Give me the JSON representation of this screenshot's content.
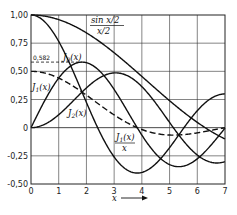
{
  "chart_data": {
    "type": "line",
    "title": "",
    "xlabel": "x",
    "ylabel": "",
    "xlim": [
      0,
      7
    ],
    "ylim": [
      -0.5,
      1.0
    ],
    "grid": true,
    "legend_position": "inline labels",
    "x_ticks": [
      "0",
      "1",
      "2",
      "3",
      "4",
      "5",
      "6",
      "7"
    ],
    "y_ticks": [
      "1,00",
      "0,75",
      "0,50",
      "0,25",
      "0",
      "-0,25",
      "-0,50"
    ],
    "y_tick_values": [
      1.0,
      0.75,
      0.5,
      0.25,
      0,
      -0.25,
      -0.5
    ],
    "annotations": [
      {
        "text": "0,582",
        "x": 0.0,
        "y": 0.582,
        "note": "dashed marker at maximum of J1(x) (x≈1.84)"
      }
    ],
    "series": [
      {
        "name": "sin x/2 / (x/2)",
        "label_num": "sin x/2",
        "label_den": "x/2",
        "style": "solid",
        "fn": "sinc_half",
        "x": [
          0,
          1,
          2,
          3,
          4,
          5,
          6,
          7
        ],
        "values": [
          1.0,
          0.959,
          0.841,
          0.665,
          0.455,
          0.239,
          0.047,
          -0.1
        ]
      },
      {
        "name": "J0(x)",
        "style": "solid",
        "fn": "j0",
        "x": [
          0,
          1,
          2,
          3,
          4,
          5,
          6,
          7
        ],
        "values": [
          1.0,
          0.765,
          0.224,
          -0.26,
          -0.397,
          -0.178,
          0.151,
          0.3
        ]
      },
      {
        "name": "J1(x)",
        "style": "solid",
        "fn": "j1",
        "x": [
          0,
          1,
          2,
          3,
          4,
          5,
          6,
          7
        ],
        "values": [
          0.0,
          0.44,
          0.577,
          0.339,
          -0.066,
          -0.328,
          -0.277,
          -0.005
        ]
      },
      {
        "name": "J2(x)",
        "style": "solid",
        "fn": "j2",
        "x": [
          0,
          1,
          2,
          3,
          4,
          5,
          6,
          7
        ],
        "values": [
          0.0,
          0.115,
          0.353,
          0.486,
          0.364,
          0.047,
          -0.243,
          -0.301
        ]
      },
      {
        "name": "J1(x)/x",
        "label_num": "J1(x)",
        "label_den": "x",
        "style": "dashed",
        "fn": "j1x",
        "x": [
          0,
          1,
          2,
          3,
          4,
          5,
          6,
          7
        ],
        "values": [
          0.5,
          0.44,
          0.288,
          0.113,
          -0.016,
          -0.066,
          -0.046,
          -0.001
        ]
      }
    ],
    "labels": {
      "sinc": {
        "num": "sin x/2",
        "den": "x/2"
      },
      "j0": "J0(x)",
      "j1": "J1(x)",
      "j2": "J2(x)",
      "j1x": {
        "num": "J1(x)",
        "den": "x"
      },
      "marker": "0,582",
      "xaxis": "x"
    },
    "colors": {
      "line": "#111111",
      "grid": "#333333",
      "background": "#ffffff"
    }
  }
}
